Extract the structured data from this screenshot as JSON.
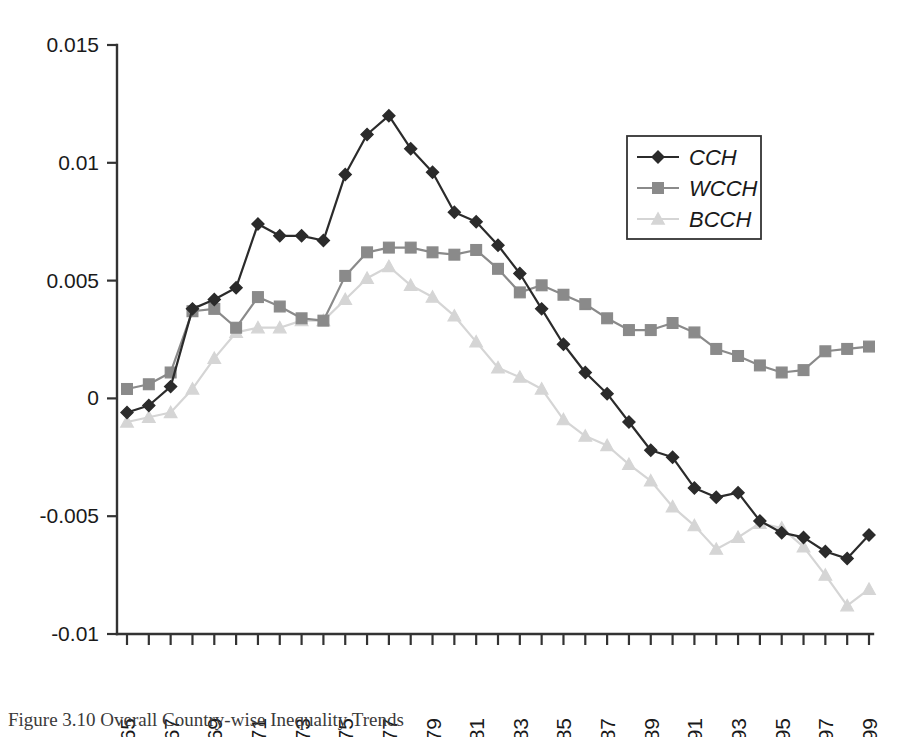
{
  "figure": {
    "background": "#ffffff",
    "caption_partial": "Figure 3.10  Overall Country-wise Inequality Trends"
  },
  "legend": {
    "position": "upper-right",
    "entries": [
      {
        "label": "CCH",
        "color": "#2b2b2b",
        "marker": "diamond-marker"
      },
      {
        "label": "WCCH",
        "color": "#8a8a8a",
        "marker": "square-marker"
      },
      {
        "label": "BCCH",
        "color": "#d5d5d5",
        "marker": "triangle-marker"
      }
    ]
  },
  "axes": {
    "y_tick_labels": [
      "0.015",
      "0.01",
      "0.005",
      "0",
      "-0.005",
      "-0.01"
    ],
    "x_tick_labels": [
      "1965",
      "1967",
      "1969",
      "1971",
      "1973",
      "1975",
      "1977",
      "1979",
      "1981",
      "1983",
      "1985",
      "1987",
      "1989",
      "1991",
      "1993",
      "1995",
      "1997",
      "1999"
    ]
  },
  "chart_data": {
    "type": "line",
    "title": "",
    "xlabel": "",
    "ylabel": "",
    "ylim": [
      -0.01,
      0.015
    ],
    "yticks": [
      0.015,
      0.01,
      0.005,
      0,
      -0.005,
      -0.01
    ],
    "grid": false,
    "legend_position": "upper-right",
    "x": [
      1965,
      1966,
      1967,
      1968,
      1969,
      1970,
      1971,
      1972,
      1973,
      1974,
      1975,
      1976,
      1977,
      1978,
      1979,
      1980,
      1981,
      1982,
      1983,
      1984,
      1985,
      1986,
      1987,
      1988,
      1989,
      1990,
      1991,
      1992,
      1993,
      1994,
      1995,
      1996,
      1997,
      1998,
      1999
    ],
    "xticks": [
      1965,
      1967,
      1969,
      1971,
      1973,
      1975,
      1977,
      1979,
      1981,
      1983,
      1985,
      1987,
      1989,
      1991,
      1993,
      1995,
      1997,
      1999
    ],
    "series": [
      {
        "name": "CCH",
        "color": "#2b2b2b",
        "marker": "diamond",
        "values": [
          -0.0006,
          -0.0003,
          0.0005,
          0.0038,
          0.0042,
          0.0047,
          0.0074,
          0.0069,
          0.0069,
          0.0067,
          0.0095,
          0.0112,
          0.012,
          0.0106,
          0.0096,
          0.0079,
          0.0075,
          0.0065,
          0.0053,
          0.0038,
          0.0023,
          0.0011,
          0.0002,
          -0.001,
          -0.0022,
          -0.0025,
          -0.0038,
          -0.0042,
          -0.004,
          -0.0052,
          -0.0057,
          -0.0059,
          -0.0065,
          -0.0068,
          -0.0058
        ]
      },
      {
        "name": "WCCH",
        "color": "#8a8a8a",
        "marker": "square",
        "values": [
          0.0004,
          0.0006,
          0.0011,
          0.0037,
          0.0038,
          0.003,
          0.0043,
          0.0039,
          0.0034,
          0.0033,
          0.0052,
          0.0062,
          0.0064,
          0.0064,
          0.0062,
          0.0061,
          0.0063,
          0.0055,
          0.0045,
          0.0048,
          0.0044,
          0.004,
          0.0034,
          0.0029,
          0.0029,
          0.0032,
          0.0028,
          0.0021,
          0.0018,
          0.0014,
          0.0011,
          0.0012,
          0.002,
          0.0021,
          0.0022
        ]
      },
      {
        "name": "BCCH",
        "color": "#d5d5d5",
        "marker": "triangle",
        "values": [
          -0.001,
          -0.0008,
          -0.0006,
          0.0004,
          0.0017,
          0.0028,
          0.003,
          0.003,
          0.0033,
          0.0033,
          0.0042,
          0.0051,
          0.0056,
          0.0048,
          0.0043,
          0.0035,
          0.0024,
          0.0013,
          0.0009,
          0.0004,
          -0.0009,
          -0.0016,
          -0.002,
          -0.0028,
          -0.0035,
          -0.0046,
          -0.0054,
          -0.0064,
          -0.0059,
          -0.0053,
          -0.0055,
          -0.0063,
          -0.0075,
          -0.0088,
          -0.0081
        ]
      }
    ]
  }
}
